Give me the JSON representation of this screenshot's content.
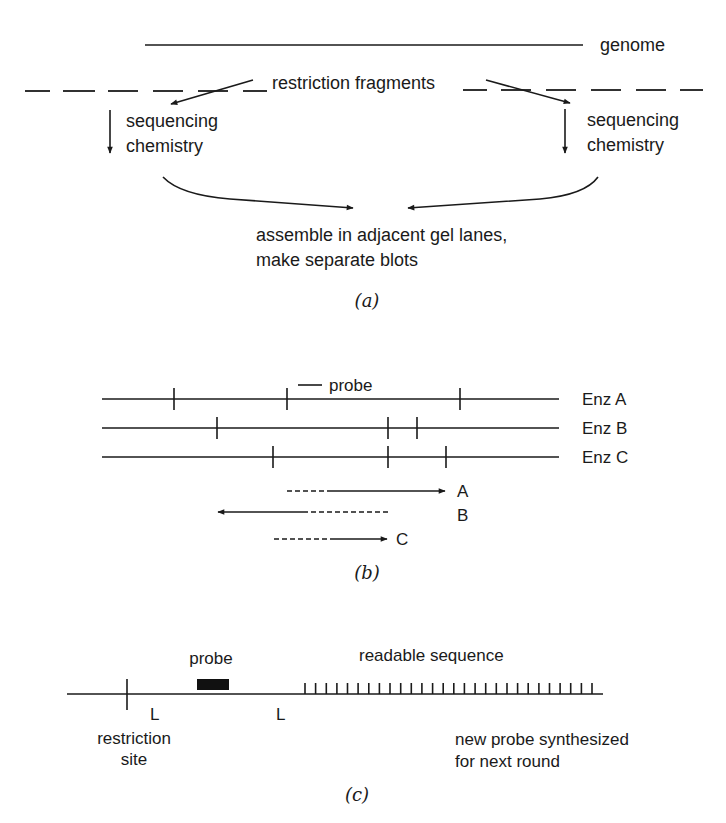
{
  "panel_a": {
    "caption": "(a)",
    "genome_label": "genome",
    "fragments_label": "restriction fragments",
    "left_step": {
      "line1": "sequencing",
      "line2": "chemistry"
    },
    "right_step": {
      "line1": "sequencing",
      "line2": "chemistry"
    },
    "result": {
      "line1": "assemble in adjacent gel lanes,",
      "line2": "make separate blots"
    }
  },
  "panel_b": {
    "caption": "(b)",
    "probe_label": "probe",
    "enzymes": [
      {
        "label": "Enz A",
        "cut_sites_x": [
          174,
          287,
          460
        ]
      },
      {
        "label": "Enz B",
        "cut_sites_x": [
          217,
          388,
          417
        ]
      },
      {
        "label": "Enz C",
        "cut_sites_x": [
          273,
          388,
          446
        ]
      }
    ],
    "reads": [
      {
        "label": "A",
        "direction": "right"
      },
      {
        "label": "B",
        "direction": "left"
      },
      {
        "label": "C",
        "direction": "right"
      }
    ]
  },
  "panel_c": {
    "caption": "(c)",
    "probe_label": "probe",
    "readable_label": "readable sequence",
    "linker_left": "L",
    "linker_right": "L",
    "site_label": {
      "line1": "restriction",
      "line2": "site"
    },
    "new_probe_label": {
      "line1": "new probe synthesized",
      "line2": "for next round"
    },
    "hatch_count": 28
  },
  "colors": {
    "ink": "#1a1a1a",
    "background": "#ffffff"
  }
}
